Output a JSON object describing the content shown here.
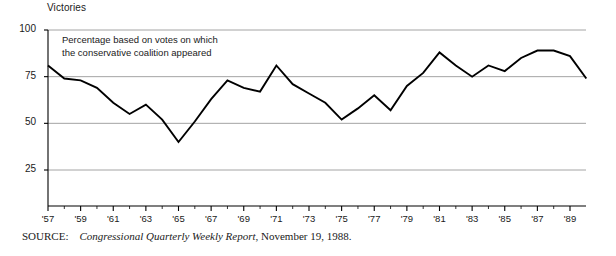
{
  "figure": {
    "axis_title": "Victories",
    "annotation": "Percentage based on votes on which\nthe conservative coalition appeared",
    "source_label": "SOURCE:",
    "source_publication": "Congressional Quarterly Weekly Report",
    "source_rest": ", November 19, 1988.",
    "line_color": "#000000",
    "grid_color": "#9a9a9a",
    "axis_color": "#000000",
    "background": "#ffffff"
  },
  "chart_data": {
    "type": "line",
    "title": "Victories",
    "subtitle": "Percentage based on votes on which the conservative coalition appeared",
    "xlabel": "",
    "ylabel": "Victories",
    "ylim": [
      0,
      100
    ],
    "yticks": [
      25,
      50,
      75,
      100
    ],
    "ytick_labels": [
      "25",
      "50",
      "75",
      "100"
    ],
    "xlim": [
      1957,
      1990
    ],
    "xticks": [
      1957,
      1959,
      1961,
      1963,
      1965,
      1967,
      1969,
      1971,
      1973,
      1975,
      1977,
      1979,
      1981,
      1983,
      1985,
      1987,
      1989
    ],
    "xtick_labels": [
      "'57",
      "'59",
      "'61",
      "'63",
      "'65",
      "'67",
      "'69",
      "'71",
      "'73",
      "'75",
      "'77",
      "'79",
      "'81",
      "'83",
      "'85",
      "'87",
      "'89"
    ],
    "minor_xticks_every": 1,
    "grid": "horizontal",
    "legend": "none",
    "x": [
      1957,
      1958,
      1959,
      1960,
      1961,
      1962,
      1963,
      1964,
      1965,
      1966,
      1967,
      1968,
      1969,
      1970,
      1971,
      1972,
      1973,
      1974,
      1975,
      1976,
      1977,
      1978,
      1979,
      1980,
      1981,
      1982,
      1983,
      1984,
      1985,
      1986,
      1987,
      1988,
      1989,
      1990
    ],
    "values": [
      81,
      74,
      73,
      69,
      61,
      55,
      60,
      52,
      40,
      51,
      63,
      73,
      69,
      67,
      81,
      71,
      66,
      61,
      52,
      58,
      65,
      57,
      70,
      77,
      88,
      81,
      75,
      81,
      78,
      85,
      89,
      89,
      86,
      74
    ],
    "series": [
      {
        "name": "Conservative coalition victories",
        "unit": "percent",
        "points": [
          {
            "year": 1957,
            "value": 81
          },
          {
            "year": 1958,
            "value": 74
          },
          {
            "year": 1959,
            "value": 73
          },
          {
            "year": 1960,
            "value": 69
          },
          {
            "year": 1961,
            "value": 61
          },
          {
            "year": 1962,
            "value": 55
          },
          {
            "year": 1963,
            "value": 60
          },
          {
            "year": 1964,
            "value": 52
          },
          {
            "year": 1965,
            "value": 40
          },
          {
            "year": 1966,
            "value": 51
          },
          {
            "year": 1967,
            "value": 63
          },
          {
            "year": 1968,
            "value": 73
          },
          {
            "year": 1969,
            "value": 69
          },
          {
            "year": 1970,
            "value": 67
          },
          {
            "year": 1971,
            "value": 81
          },
          {
            "year": 1972,
            "value": 71
          },
          {
            "year": 1973,
            "value": 66
          },
          {
            "year": 1974,
            "value": 61
          },
          {
            "year": 1975,
            "value": 52
          },
          {
            "year": 1976,
            "value": 58
          },
          {
            "year": 1977,
            "value": 65
          },
          {
            "year": 1978,
            "value": 57
          },
          {
            "year": 1979,
            "value": 70
          },
          {
            "year": 1980,
            "value": 77
          },
          {
            "year": 1981,
            "value": 88
          },
          {
            "year": 1982,
            "value": 81
          },
          {
            "year": 1983,
            "value": 75
          },
          {
            "year": 1984,
            "value": 81
          },
          {
            "year": 1985,
            "value": 78
          },
          {
            "year": 1986,
            "value": 85
          },
          {
            "year": 1987,
            "value": 89
          },
          {
            "year": 1988,
            "value": 89
          },
          {
            "year": 1989,
            "value": 86
          },
          {
            "year": 1990,
            "value": 74
          }
        ]
      }
    ]
  }
}
